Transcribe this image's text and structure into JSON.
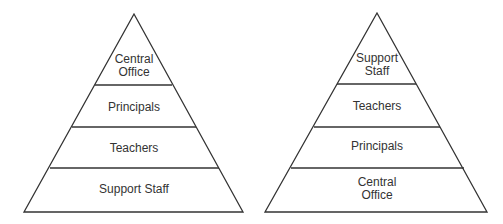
{
  "diagram": {
    "type": "two pyramids",
    "line_color": "#333333",
    "left_pyramid": {
      "levels_top_to_bottom": [
        {
          "label": "Central\nOffice"
        },
        {
          "label": "Principals"
        },
        {
          "label": "Teachers"
        },
        {
          "label": "Support Staff"
        }
      ]
    },
    "right_pyramid": {
      "levels_top_to_bottom": [
        {
          "label": "Support\nStaff"
        },
        {
          "label": "Teachers"
        },
        {
          "label": "Principals"
        },
        {
          "label": "Central\nOffice"
        }
      ]
    }
  }
}
